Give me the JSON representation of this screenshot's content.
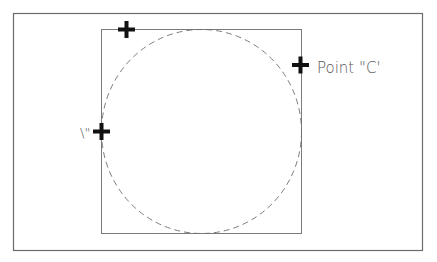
{
  "diagram": {
    "title": "",
    "colors": {
      "background": "#ffffff",
      "frame": "#6b6b6b",
      "square": "#7a7a7a",
      "circle": "#6e6e6e",
      "marker": "#111111",
      "label": "#555555"
    },
    "outer_frame": {
      "x": 13,
      "y": 13,
      "width": 409,
      "height": 237
    },
    "square": {
      "x": 101,
      "y": 29,
      "width": 200,
      "height": 204
    },
    "circle": {
      "cx": 201,
      "cy": 131,
      "rx": 100,
      "ry": 102,
      "style": "dashed"
    },
    "markers": [
      {
        "id": "point-b",
        "x": 126,
        "y": 29,
        "icon": "plus-cross-icon"
      },
      {
        "id": "point-c",
        "x": 301,
        "y": 65,
        "icon": "plus-cross-icon"
      },
      {
        "id": "point-a",
        "x": 101,
        "y": 131,
        "icon": "plus-cross-icon"
      }
    ],
    "labels": {
      "point_c": "Point \"C'",
      "point_a_partial": "\\\""
    }
  }
}
